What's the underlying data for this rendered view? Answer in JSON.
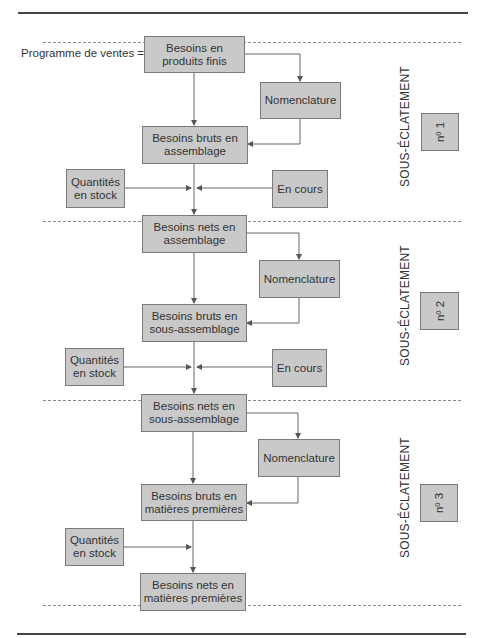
{
  "diagram": {
    "input_label": "Programme de ventes =",
    "levels": [
      {
        "side_label": "SOUS-ÉCLATEMENT",
        "number_label": "nº 1",
        "main_box": "Besoins en produits finis",
        "main_lines": [
          "Besoins en",
          "produits finis"
        ],
        "nomenclature": "Nomenclature",
        "gross_lines": [
          "Besoins bruts en",
          "assemblage"
        ],
        "stock_lines": [
          "Quantités",
          "en stock"
        ],
        "in_progress": "En cours"
      },
      {
        "side_label": "SOUS-ÉCLATEMENT",
        "number_label": "nº 2",
        "main_lines": [
          "Besoins nets en",
          "assemblage"
        ],
        "nomenclature": "Nomenclature",
        "gross_lines": [
          "Besoins bruts en",
          "sous-assemblage"
        ],
        "stock_lines": [
          "Quantités",
          "en stock"
        ],
        "in_progress": "En cours"
      },
      {
        "side_label": "SOUS-ÉCLATEMENT",
        "number_label": "nº 3",
        "main_lines": [
          "Besoins nets en",
          "sous-assemblage"
        ],
        "nomenclature": "Nomenclature",
        "gross_lines": [
          "Besoins bruts en",
          "matières premières"
        ],
        "stock_lines": [
          "Quantités",
          "en stock"
        ]
      }
    ],
    "final_lines": [
      "Besoins nets en",
      "matières premières"
    ],
    "colors": {
      "box_fill": "#c9c9c9",
      "box_border": "#7a7a7a",
      "line": "#555555",
      "text": "#333333"
    }
  }
}
